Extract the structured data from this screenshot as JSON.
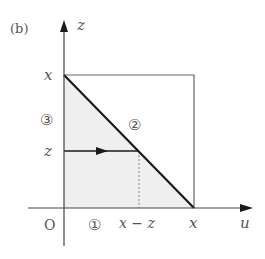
{
  "figure": {
    "panel_label": "(b)",
    "axes": {
      "vertical_label": "z",
      "horizontal_label": "u",
      "origin_label": "O"
    },
    "tick_labels": {
      "z_axis_top": "x",
      "z_axis_mid": "z",
      "u_axis_mid": "x − z",
      "u_axis_right": "x"
    },
    "region_labels": {
      "region1": "①",
      "region2": "②",
      "region3": "③"
    },
    "colors": {
      "shade": "#efefef",
      "line": "#1a1a1a",
      "box": "#666666",
      "text": "#555555"
    }
  }
}
